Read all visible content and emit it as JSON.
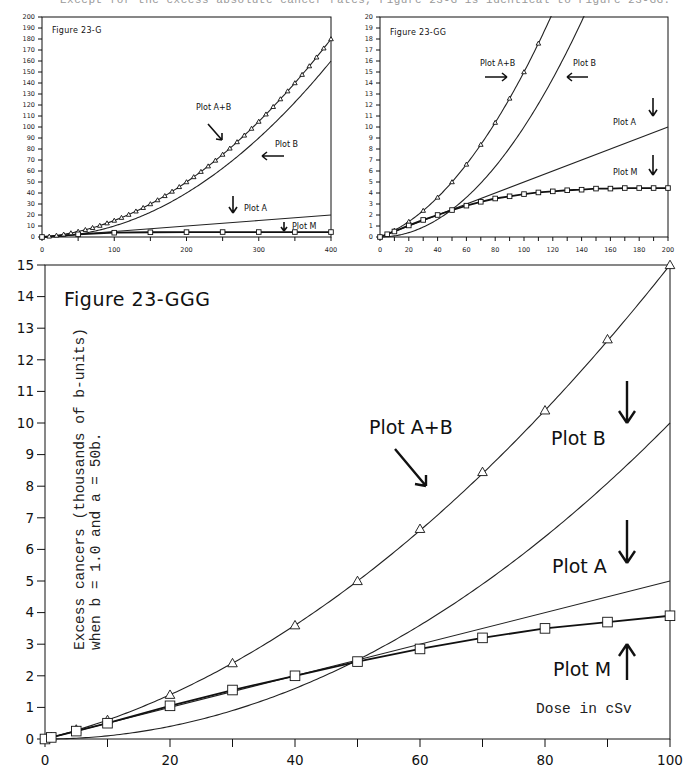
{
  "page": {
    "caption_fragment": "Except for the excess absolute cancer rates, Figure 23-G is identical to Figure 23-GG."
  },
  "chart_data": [
    {
      "id": "fig-23-g",
      "type": "line",
      "title": "Figure 23-G",
      "xlabel": "",
      "ylabel": "",
      "xlim": [
        0,
        400
      ],
      "ylim": [
        0,
        200
      ],
      "x_ticks": [
        0,
        100,
        200,
        300,
        400
      ],
      "y_ticks": [
        0,
        10,
        20,
        30,
        40,
        50,
        60,
        70,
        80,
        90,
        100,
        110,
        120,
        130,
        140,
        150,
        160,
        170,
        180,
        190,
        200
      ],
      "grid": false,
      "legend": "annotations",
      "series": [
        {
          "name": "Plot A+B",
          "marker": "triangle",
          "formula": "0.05x + 0.001x^2",
          "x": [
            0,
            10,
            20,
            30,
            40,
            50,
            60,
            70,
            80,
            90,
            100,
            110,
            120,
            130,
            140,
            150,
            160,
            170,
            180,
            190,
            200,
            210,
            220,
            230,
            240,
            250,
            260,
            270,
            280,
            290,
            300,
            310,
            320,
            330,
            340,
            350,
            360,
            370,
            380,
            390,
            400
          ],
          "values": [
            0,
            0.6,
            1.4,
            2.4,
            3.6,
            5.0,
            6.6,
            8.4,
            10.4,
            12.6,
            15.0,
            17.6,
            20.4,
            23.4,
            26.6,
            30.0,
            33.6,
            37.4,
            41.4,
            45.6,
            50.0,
            54.6,
            59.4,
            64.4,
            69.6,
            75.0,
            80.6,
            86.4,
            92.4,
            98.6,
            105.0,
            111.6,
            118.4,
            125.4,
            132.6,
            140.0,
            147.6,
            155.4,
            163.4,
            171.6,
            180.0
          ]
        },
        {
          "name": "Plot B",
          "marker": "none",
          "formula": "0.001x^2",
          "x": [
            0,
            100,
            200,
            300,
            400
          ],
          "values": [
            0,
            10,
            40,
            90,
            160
          ]
        },
        {
          "name": "Plot A",
          "marker": "none",
          "formula": "0.05x",
          "x": [
            0,
            100,
            200,
            300,
            400
          ],
          "values": [
            0,
            5,
            10,
            15,
            20
          ]
        },
        {
          "name": "Plot M",
          "marker": "square",
          "x": [
            0,
            50,
            100,
            150,
            200,
            250,
            300,
            350,
            400
          ],
          "values": [
            0,
            2.45,
            3.9,
            4.3,
            4.45,
            4.5,
            4.5,
            4.5,
            4.5
          ]
        }
      ],
      "annotations": [
        "Plot A+B",
        "Plot B",
        "Plot A",
        "Plot M"
      ]
    },
    {
      "id": "fig-23-gg",
      "type": "line",
      "title": "Figure 23-GG",
      "xlabel": "",
      "ylabel": "",
      "xlim": [
        0,
        200
      ],
      "ylim": [
        0,
        20
      ],
      "x_ticks": [
        0,
        20,
        40,
        60,
        80,
        100,
        120,
        140,
        160,
        180,
        200
      ],
      "y_ticks": [
        0,
        1,
        2,
        3,
        4,
        5,
        6,
        7,
        8,
        9,
        10,
        11,
        12,
        13,
        14,
        15,
        16,
        17,
        18,
        19,
        20
      ],
      "grid": false,
      "legend": "annotations",
      "series": [
        {
          "name": "Plot A+B",
          "marker": "triangle",
          "x": [
            0,
            10,
            20,
            30,
            40,
            50,
            60,
            70,
            80,
            90,
            100,
            110
          ],
          "values": [
            0,
            0.6,
            1.4,
            2.4,
            3.6,
            5.0,
            6.6,
            8.4,
            10.4,
            12.6,
            15.0,
            17.6
          ]
        },
        {
          "name": "Plot B",
          "marker": "none",
          "x": [
            0,
            20,
            40,
            60,
            80,
            100,
            120,
            140
          ],
          "values": [
            0,
            0.4,
            1.6,
            3.6,
            6.4,
            10.0,
            14.4,
            19.6
          ]
        },
        {
          "name": "Plot A",
          "marker": "none",
          "x": [
            0,
            200
          ],
          "values": [
            0,
            10
          ]
        },
        {
          "name": "Plot M",
          "marker": "square",
          "x": [
            0,
            5,
            10,
            20,
            30,
            40,
            50,
            60,
            70,
            80,
            90,
            100,
            110,
            120,
            130,
            140,
            150,
            160,
            170,
            180,
            190,
            200
          ],
          "values": [
            0,
            0.25,
            0.5,
            1.05,
            1.55,
            2.0,
            2.45,
            2.85,
            3.2,
            3.5,
            3.7,
            3.9,
            4.05,
            4.15,
            4.25,
            4.3,
            4.4,
            4.4,
            4.45,
            4.45,
            4.45,
            4.45
          ]
        }
      ],
      "annotations": [
        "Plot A+B",
        "Plot B",
        "Plot A",
        "Plot M"
      ]
    },
    {
      "id": "fig-23-ggg",
      "type": "line",
      "title": "Figure 23-GGG",
      "xlabel": "Dose in cSv",
      "ylabel": "Excess cancers (thousands of b-units) when b = 1.0 and a = 50b.",
      "ylabel_line1": "Excess cancers (thousands of b-units)",
      "ylabel_line2": "when b = 1.0 and a = 50b.",
      "xlim": [
        0,
        100
      ],
      "ylim": [
        0,
        15
      ],
      "x_ticks": [
        0,
        20,
        40,
        60,
        80,
        100
      ],
      "y_ticks": [
        0,
        1,
        2,
        3,
        4,
        5,
        6,
        7,
        8,
        9,
        10,
        11,
        12,
        13,
        14,
        15
      ],
      "grid": false,
      "legend": "annotations",
      "series": [
        {
          "name": "Plot A+B",
          "marker": "triangle",
          "x": [
            0,
            1,
            5,
            10,
            20,
            30,
            40,
            50,
            60,
            70,
            80,
            90,
            100
          ],
          "values": [
            0,
            0.06,
            0.3,
            0.6,
            1.4,
            2.4,
            3.6,
            5.0,
            6.65,
            8.45,
            10.4,
            12.65,
            15.0
          ]
        },
        {
          "name": "Plot B",
          "marker": "none",
          "x": [
            0,
            10,
            20,
            30,
            40,
            50,
            60,
            70,
            80,
            90,
            100
          ],
          "values": [
            0,
            0.1,
            0.4,
            0.9,
            1.6,
            2.5,
            3.6,
            4.9,
            6.4,
            8.1,
            10.0
          ]
        },
        {
          "name": "Plot A",
          "marker": "none",
          "x": [
            0,
            50,
            100
          ],
          "values": [
            0,
            2.5,
            5.0
          ]
        },
        {
          "name": "Plot M",
          "marker": "square",
          "x": [
            0,
            1,
            5,
            10,
            20,
            30,
            40,
            50,
            60,
            70,
            80,
            90,
            100
          ],
          "values": [
            0,
            0.05,
            0.25,
            0.5,
            1.05,
            1.55,
            2.0,
            2.45,
            2.85,
            3.2,
            3.5,
            3.7,
            3.9
          ]
        }
      ],
      "annotations": [
        "Plot A+B",
        "Plot B",
        "Plot A",
        "Plot M",
        "Dose in cSv"
      ]
    }
  ],
  "labels": {
    "fig_g_title": "Figure 23-G",
    "fig_gg_title": "Figure 23-GG",
    "fig_ggg_title": "Figure 23-GGG",
    "plot_ab": "Plot A+B",
    "plot_b": "Plot B",
    "plot_a": "Plot A",
    "plot_m": "Plot M",
    "dose": "Dose in cSv",
    "ylabel_line1": "Excess cancers (thousands of b-units)",
    "ylabel_line2": "when b = 1.0 and a = 50b."
  }
}
